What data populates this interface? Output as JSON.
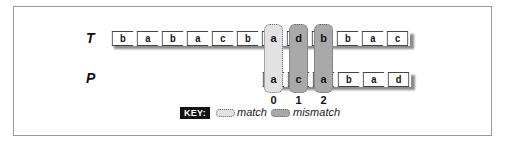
{
  "diagram": {
    "text_label": "T",
    "pattern_label": "P",
    "text_chars": [
      "b",
      "a",
      "b",
      "a",
      "c",
      "b",
      "a",
      "d",
      "b",
      "b",
      "a",
      "c"
    ],
    "pattern_chars": [
      "a",
      "c",
      "a",
      "b",
      "a",
      "d"
    ],
    "pattern_offset": 6,
    "comparisons": [
      {
        "index": "0",
        "text_char": "a",
        "pattern_char": "a",
        "result": "match"
      },
      {
        "index": "1",
        "text_char": "d",
        "pattern_char": "c",
        "result": "mismatch"
      },
      {
        "index": "2",
        "text_char": "b",
        "pattern_char": "a",
        "result": "mismatch"
      }
    ]
  },
  "key": {
    "badge": "KEY:",
    "match_label": "match",
    "mismatch_label": "mismatch"
  },
  "colors": {
    "match": "#e2e2e2",
    "mismatch": "#a9a9a9",
    "border": "#444444",
    "frame": "#9a9a9a"
  }
}
